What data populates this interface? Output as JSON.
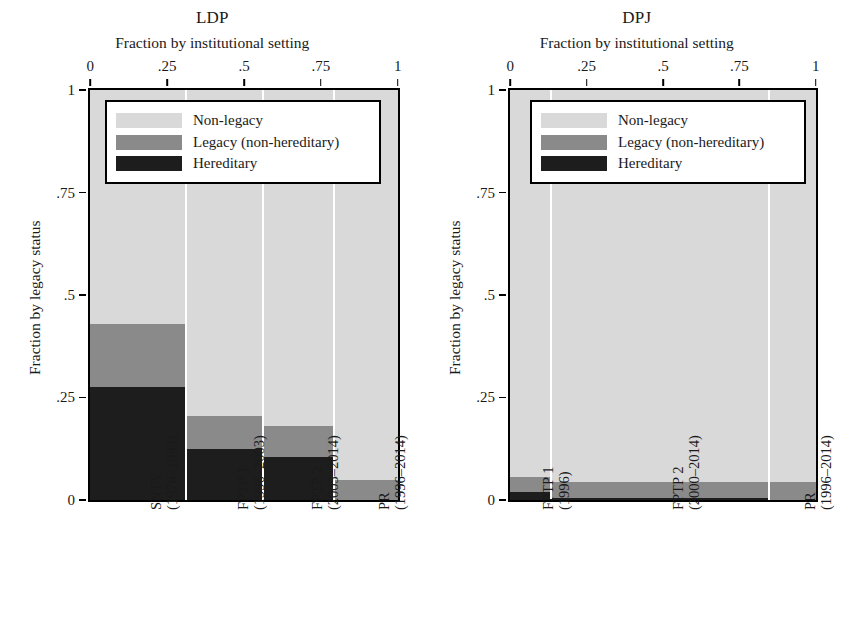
{
  "figure": {
    "shared": {
      "xaxis_title": "Fraction by institutional setting",
      "yaxis_title": "Fraction by legacy status",
      "xticks": [
        "0",
        ".25",
        ".5",
        ".75",
        "1"
      ],
      "yticks": [
        "1",
        ".75",
        ".5",
        ".25",
        "0"
      ],
      "legend": [
        {
          "key": "nonlegacy",
          "label": "Non-legacy",
          "color": "#d9d9d9"
        },
        {
          "key": "legacy",
          "label": "Legacy (non-hereditary)",
          "color": "#8a8a8a"
        },
        {
          "key": "hereditary",
          "label": "Hereditary",
          "color": "#1d1d1d"
        }
      ]
    },
    "panels": [
      {
        "id": "ldp",
        "title": "LDP"
      },
      {
        "id": "dpj",
        "title": "DPJ"
      }
    ]
  },
  "chart_data": [
    {
      "type": "bar",
      "subtype": "stacked-mosaic",
      "title": "LDP",
      "xlabel": "Fraction by institutional setting",
      "ylabel": "Fraction by legacy status",
      "xlim": [
        0,
        1
      ],
      "ylim": [
        0,
        1
      ],
      "xticks": [
        0,
        0.25,
        0.5,
        0.75,
        1
      ],
      "yticks": [
        0,
        0.25,
        0.5,
        0.75,
        1
      ],
      "grid": false,
      "legend_position": "top-center-inside",
      "categories": [
        {
          "label": "SNTV\n(1976–1993)",
          "line1": "SNTV",
          "line2": "(1976–1993)",
          "width": 0.315
        },
        {
          "label": "FPTP 1\n(1996–2003)",
          "line1": "FPTP 1",
          "line2": "(1996–2003)",
          "width": 0.25
        },
        {
          "label": "FPTP 2\n(2005–2014)",
          "line1": "FPTP 2",
          "line2": "(2005–2014)",
          "width": 0.233
        },
        {
          "label": "PR\n(1996–2014)",
          "line1": "PR",
          "line2": "(1996–2014)",
          "width": 0.202
        }
      ],
      "series": [
        {
          "name": "Hereditary",
          "values": [
            0.275,
            0.125,
            0.105,
            0.0
          ]
        },
        {
          "name": "Legacy (non-hereditary)",
          "values": [
            0.155,
            0.08,
            0.075,
            0.048
          ]
        },
        {
          "name": "Non-legacy",
          "values": [
            0.57,
            0.795,
            0.82,
            0.952
          ]
        }
      ]
    },
    {
      "type": "bar",
      "subtype": "stacked-mosaic",
      "title": "DPJ",
      "xlabel": "Fraction by institutional setting",
      "ylabel": "Fraction by legacy status",
      "xlim": [
        0,
        1
      ],
      "ylim": [
        0,
        1
      ],
      "xticks": [
        0,
        0.25,
        0.5,
        0.75,
        1
      ],
      "yticks": [
        0,
        0.25,
        0.5,
        0.75,
        1
      ],
      "grid": false,
      "legend_position": "top-center-inside",
      "categories": [
        {
          "label": "FPTP 1\n(1996)",
          "line1": "FPTP 1",
          "line2": "(1996)",
          "width": 0.137
        },
        {
          "label": "FPTP 2\n(2000–2014)",
          "line1": "FPTP 2",
          "line2": "(2000–2014)",
          "width": 0.715
        },
        {
          "label": "PR\n(1996–2014)",
          "line1": "PR",
          "line2": "(1996–2014)",
          "width": 0.148
        }
      ],
      "series": [
        {
          "name": "Hereditary",
          "values": [
            0.02,
            0.005,
            0.0
          ]
        },
        {
          "name": "Legacy (non-hereditary)",
          "values": [
            0.035,
            0.04,
            0.045
          ]
        },
        {
          "name": "Non-legacy",
          "values": [
            0.945,
            0.955,
            0.955
          ]
        }
      ]
    }
  ]
}
